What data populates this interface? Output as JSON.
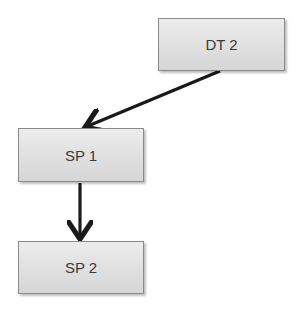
{
  "diagram": {
    "type": "flow",
    "nodes": [
      {
        "id": "dt2",
        "label": "DT 2"
      },
      {
        "id": "sp1",
        "label": "SP 1"
      },
      {
        "id": "sp2",
        "label": "SP 2"
      }
    ],
    "edges": [
      {
        "from": "dt2",
        "to": "sp1"
      },
      {
        "from": "sp1",
        "to": "sp2"
      }
    ],
    "colors": {
      "box_fill": "#e0e0e0",
      "box_border": "#8a8a8a",
      "arrow": "#1a1a1a",
      "text": "#3a3a3a"
    }
  }
}
